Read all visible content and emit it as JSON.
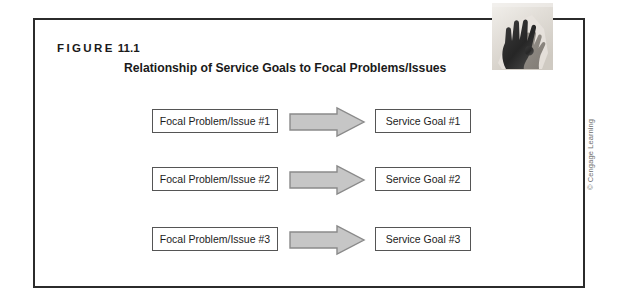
{
  "figure": {
    "label_word": "FIGURE",
    "label_number": "11.1",
    "title": "Relationship of Service Goals to Focal Problems/Issues",
    "credit": "© Cengage Learning",
    "frame_color": "#2b2b2b",
    "box_border_color": "#555555",
    "arrow_fill_color": "#c6c6c6",
    "arrow_stroke_color": "#8a8a8a",
    "photo_alt": "hands-photo"
  },
  "diagram": {
    "rows": [
      {
        "problem": "Focal Problem/Issue #1",
        "arrow": "right-arrow-icon",
        "goal": "Service Goal #1"
      },
      {
        "problem": "Focal Problem/Issue #2",
        "arrow": "right-arrow-icon",
        "goal": "Service Goal #2"
      },
      {
        "problem": "Focal Problem/Issue #3",
        "arrow": "right-arrow-icon",
        "goal": "Service Goal #3"
      }
    ]
  }
}
